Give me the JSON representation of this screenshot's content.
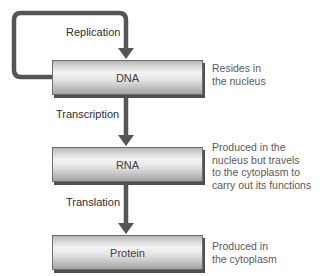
{
  "diagram": {
    "type": "flowchart",
    "nodes": [
      {
        "id": "dna",
        "label": "DNA",
        "note_lines": [
          "Resides in",
          "the nucleus"
        ]
      },
      {
        "id": "rna",
        "label": "RNA",
        "note_lines": [
          "Produced in the",
          "nucleus but travels",
          "to the cytoplasm to",
          "carry out its functions"
        ]
      },
      {
        "id": "protein",
        "label": "Protein",
        "note_lines": [
          "Produced in",
          "the cytoplasm"
        ]
      }
    ],
    "edges": [
      {
        "from": "dna",
        "to": "dna",
        "label": "Replication",
        "style": "loop"
      },
      {
        "from": "dna",
        "to": "rna",
        "label": "Transcription"
      },
      {
        "from": "rna",
        "to": "protein",
        "label": "Translation"
      }
    ]
  },
  "colors": {
    "arrow": "#555555",
    "box_border": "#6f6f6f",
    "box_shadow": "#4f4f4f",
    "label_text": "#2e2e2e",
    "note_text": "#5a5a5a",
    "background": "#ffffff"
  }
}
